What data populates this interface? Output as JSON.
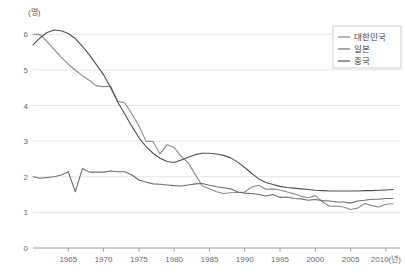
{
  "chart_data": {
    "type": "line",
    "title": "",
    "subtitle": "",
    "xlabel": "2010(년)",
    "ylabel": "(명)",
    "yunit_label": "(명)",
    "xunit_label": "(년)",
    "grid": true,
    "legend_position": "top-right",
    "xlim": [
      1960,
      2012
    ],
    "ylim": [
      0,
      6.4
    ],
    "xticks": [
      1965,
      1970,
      1975,
      1980,
      1985,
      1990,
      1995,
      2000,
      2005,
      2010
    ],
    "xticklabels": [
      "1965",
      "1970",
      "1975",
      "1980",
      "1985",
      "1990",
      "1995",
      "2000",
      "2005",
      "2010(년)"
    ],
    "yticks": [
      0,
      1,
      2,
      3,
      4,
      5,
      6
    ],
    "yticklabels": [
      "0",
      "1",
      "2",
      "3",
      "4",
      "5",
      "6"
    ],
    "colors": {
      "korea": "#8a8a8a",
      "japan": "#6d6d6d",
      "china": "#4f4f4f",
      "grid": "#e6e6e6",
      "axis": "#9a9a9a",
      "text": "#6b6b6b"
    },
    "series": [
      {
        "name": "대한민국",
        "key": "korea",
        "color": "#8a8a8a",
        "x": [
          1960,
          1961,
          1962,
          1963,
          1964,
          1965,
          1966,
          1967,
          1968,
          1969,
          1970,
          1971,
          1972,
          1973,
          1974,
          1975,
          1976,
          1977,
          1978,
          1979,
          1980,
          1981,
          1982,
          1983,
          1984,
          1985,
          1986,
          1987,
          1988,
          1989,
          1990,
          1991,
          1992,
          1993,
          1994,
          1995,
          1996,
          1997,
          1998,
          1999,
          2000,
          2001,
          2002,
          2003,
          2004,
          2005,
          2006,
          2007,
          2008,
          2009,
          2010,
          2011
        ],
        "values": [
          6.0,
          5.99,
          5.79,
          5.57,
          5.36,
          5.16,
          4.99,
          4.84,
          4.7,
          4.55,
          4.53,
          4.54,
          4.12,
          4.07,
          3.77,
          3.43,
          3.0,
          2.99,
          2.64,
          2.9,
          2.82,
          2.57,
          2.39,
          2.06,
          1.74,
          1.66,
          1.58,
          1.53,
          1.55,
          1.56,
          1.57,
          1.71,
          1.76,
          1.65,
          1.66,
          1.63,
          1.57,
          1.52,
          1.45,
          1.41,
          1.47,
          1.3,
          1.17,
          1.18,
          1.15,
          1.08,
          1.12,
          1.25,
          1.19,
          1.15,
          1.23,
          1.24
        ]
      },
      {
        "name": "일본",
        "key": "japan",
        "color": "#6d6d6d",
        "x": [
          1960,
          1961,
          1962,
          1963,
          1964,
          1965,
          1966,
          1967,
          1968,
          1969,
          1970,
          1971,
          1972,
          1973,
          1974,
          1975,
          1976,
          1977,
          1978,
          1979,
          1980,
          1981,
          1982,
          1983,
          1984,
          1985,
          1986,
          1987,
          1988,
          1989,
          1990,
          1991,
          1992,
          1993,
          1994,
          1995,
          1996,
          1997,
          1998,
          1999,
          2000,
          2001,
          2002,
          2003,
          2004,
          2005,
          2006,
          2007,
          2008,
          2009,
          2010,
          2011
        ],
        "values": [
          2.0,
          1.96,
          1.98,
          2.0,
          2.05,
          2.14,
          1.58,
          2.23,
          2.13,
          2.13,
          2.13,
          2.16,
          2.14,
          2.14,
          2.05,
          1.91,
          1.85,
          1.8,
          1.79,
          1.77,
          1.75,
          1.74,
          1.77,
          1.8,
          1.81,
          1.76,
          1.72,
          1.69,
          1.66,
          1.57,
          1.54,
          1.53,
          1.5,
          1.46,
          1.5,
          1.42,
          1.43,
          1.39,
          1.38,
          1.34,
          1.36,
          1.33,
          1.32,
          1.29,
          1.29,
          1.26,
          1.32,
          1.34,
          1.37,
          1.37,
          1.39,
          1.39
        ]
      },
      {
        "name": "중국",
        "key": "china",
        "color": "#4f4f4f",
        "x": [
          1960,
          1961,
          1962,
          1963,
          1964,
          1965,
          1966,
          1967,
          1968,
          1969,
          1970,
          1971,
          1972,
          1973,
          1974,
          1975,
          1976,
          1977,
          1978,
          1979,
          1980,
          1981,
          1982,
          1983,
          1984,
          1985,
          1986,
          1987,
          1988,
          1989,
          1990,
          1991,
          1992,
          1993,
          1994,
          1995,
          1996,
          1997,
          1998,
          1999,
          2000,
          2001,
          2002,
          2003,
          2004,
          2005,
          2006,
          2007,
          2008,
          2009,
          2010,
          2011
        ],
        "values": [
          5.7,
          5.9,
          6.05,
          6.12,
          6.1,
          6.02,
          5.88,
          5.66,
          5.42,
          5.14,
          4.86,
          4.5,
          4.1,
          3.76,
          3.42,
          3.1,
          2.85,
          2.66,
          2.52,
          2.43,
          2.4,
          2.47,
          2.55,
          2.62,
          2.66,
          2.66,
          2.64,
          2.6,
          2.53,
          2.41,
          2.26,
          2.09,
          1.94,
          1.84,
          1.78,
          1.73,
          1.7,
          1.68,
          1.66,
          1.64,
          1.62,
          1.61,
          1.6,
          1.6,
          1.6,
          1.6,
          1.6,
          1.61,
          1.61,
          1.62,
          1.63,
          1.64
        ]
      }
    ]
  },
  "legend": {
    "items": [
      {
        "label": "대한민국",
        "color": "#8a8a8a"
      },
      {
        "label": "일본",
        "color": "#6d6d6d"
      },
      {
        "label": "중국",
        "color": "#4f4f4f"
      }
    ]
  },
  "axes": {
    "y_unit": "(명)",
    "y_labels": [
      "6",
      "5",
      "4",
      "3",
      "2",
      "1",
      "0"
    ],
    "x_labels": [
      "1965",
      "1970",
      "1975",
      "1980",
      "1985",
      "1990",
      "1995",
      "2000",
      "2005",
      "2010(년)"
    ]
  }
}
